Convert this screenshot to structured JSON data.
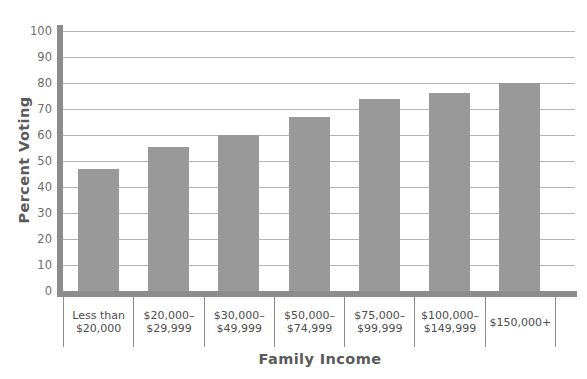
{
  "chart_data": {
    "type": "bar",
    "title": "",
    "xlabel": "Family Income",
    "ylabel": "Percent Voting",
    "ylim": [
      0,
      100
    ],
    "yticks": [
      0,
      10,
      20,
      30,
      40,
      50,
      60,
      70,
      80,
      90,
      100
    ],
    "grid": true,
    "legend": "none",
    "bar_color": "#999999",
    "axis_color": "#8c8c8c",
    "gridline_color": "#b4b4b4",
    "categories": [
      "Less than\n$20,000",
      "$20,000–\n$29,999",
      "$30,000–\n$49,999",
      "$50,000–\n$74,999",
      "$75,000–\n$99,999",
      "$100,000–\n$149,999",
      "$150,000+"
    ],
    "values": [
      47,
      55.5,
      60,
      67,
      74,
      76,
      80
    ]
  }
}
